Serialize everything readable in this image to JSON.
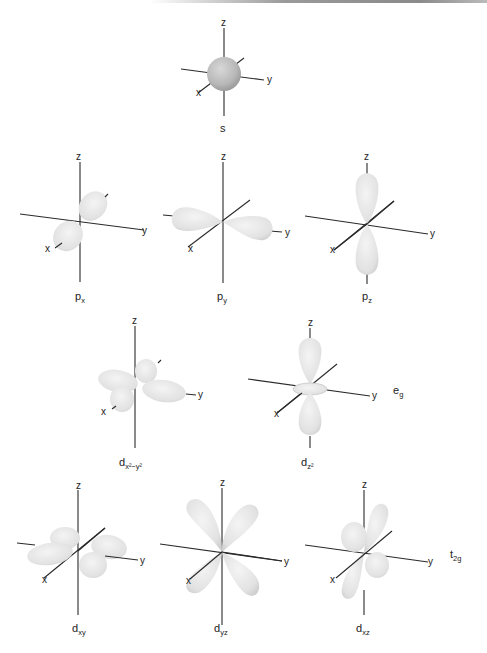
{
  "figure": {
    "axis_labels": {
      "x": "x",
      "y": "y",
      "z": "z"
    },
    "orbitals": [
      {
        "id": "s",
        "main": "s",
        "sub": ""
      },
      {
        "id": "px",
        "main": "p",
        "sub": "x"
      },
      {
        "id": "py",
        "main": "p",
        "sub": "y"
      },
      {
        "id": "pz",
        "main": "p",
        "sub": "z"
      },
      {
        "id": "dx2y2",
        "main": "d",
        "sub": "x²−y²"
      },
      {
        "id": "dz2",
        "main": "d",
        "sub": "z²"
      },
      {
        "id": "dxy",
        "main": "d",
        "sub": "xy"
      },
      {
        "id": "dyz",
        "main": "d",
        "sub": "yz"
      },
      {
        "id": "dxz",
        "main": "d",
        "sub": "xz"
      }
    ],
    "groups": [
      {
        "id": "eg",
        "main": "e",
        "sub": "g"
      },
      {
        "id": "t2g",
        "main": "t",
        "sub": "2g"
      }
    ],
    "colors": {
      "lobe": "#e6e6e6",
      "lobe_edge": "#c4c4c4",
      "axis": "#2a2a2a"
    }
  }
}
